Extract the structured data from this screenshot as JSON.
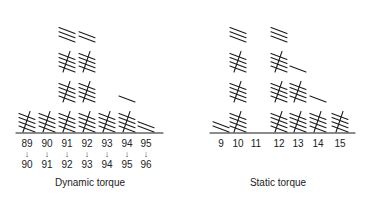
{
  "chart_data": [
    {
      "type": "tally",
      "title": "Dynamic torque",
      "categories": [
        "89→90",
        "90→91",
        "91→92",
        "92→93",
        "93→94",
        "94→95",
        "95→96"
      ],
      "tick_labels_top": [
        "89",
        "90",
        "91",
        "92",
        "93",
        "94",
        "95"
      ],
      "tick_labels_bottom": [
        "90",
        "91",
        "92",
        "93",
        "94",
        "95",
        "96"
      ],
      "values": [
        5,
        5,
        18,
        17,
        5,
        6,
        2
      ],
      "x_centers": [
        27,
        47,
        67,
        87,
        107,
        127,
        146
      ],
      "baseline": {
        "x1": 16,
        "x2": 163,
        "y": 133
      },
      "title_x": 90
    },
    {
      "type": "tally",
      "title": "Static torque",
      "categories": [
        "9",
        "10",
        "11",
        "12",
        "13",
        "14",
        "15"
      ],
      "tick_labels_top": [
        "9",
        "10",
        "11",
        "12",
        "13",
        "14",
        "15"
      ],
      "values": [
        2,
        18,
        0,
        18,
        11,
        6,
        5
      ],
      "x_centers": [
        221,
        238,
        256,
        279,
        298,
        318,
        340
      ],
      "baseline": {
        "x1": 210,
        "x2": 355,
        "y": 133
      },
      "title_x": 278
    }
  ]
}
